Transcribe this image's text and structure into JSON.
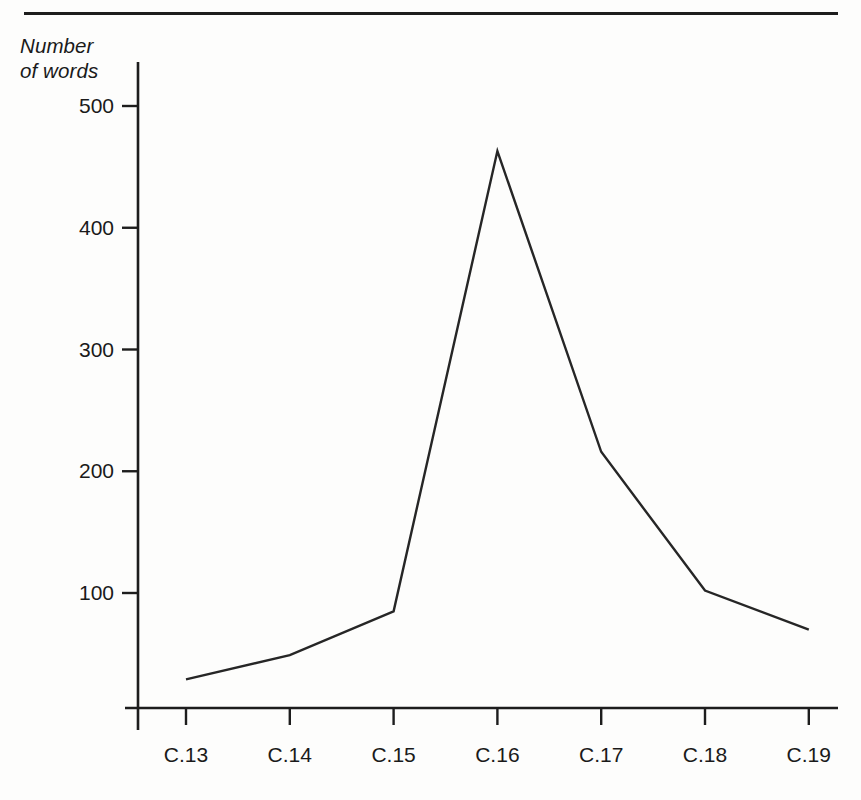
{
  "figure": {
    "axis_title": "Number\nof words",
    "line_color": "#262626",
    "axis_color": "#1d1d1d",
    "background": "#fdfdfc"
  },
  "chart_data": {
    "type": "line",
    "title": "",
    "xlabel": "",
    "ylabel": "Number of words",
    "categories": [
      "C.13",
      "C.14",
      "C.15",
      "C.16",
      "C.17",
      "C.18",
      "C.19"
    ],
    "values": [
      29,
      49,
      85,
      463,
      216,
      102,
      70
    ],
    "series": [
      {
        "name": "Number of words",
        "values": [
          29,
          49,
          85,
          463,
          216,
          102,
          70
        ]
      }
    ],
    "ytick_labels": [
      "100",
      "200",
      "300",
      "400",
      "500"
    ],
    "ytick_values": [
      100,
      200,
      300,
      400,
      500
    ],
    "ylim": [
      0,
      540
    ],
    "grid": false,
    "legend": "none",
    "markers": false
  }
}
